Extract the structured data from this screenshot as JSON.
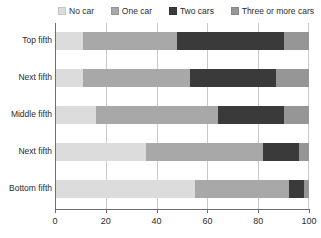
{
  "legend": {
    "position": "top",
    "items": [
      {
        "label": "No car",
        "color": "#dcdcdc",
        "icon": "legend-swatch-no-car"
      },
      {
        "label": "One car",
        "color": "#a8a8a8",
        "icon": "legend-swatch-one-car"
      },
      {
        "label": "Two cars",
        "color": "#3a3a3a",
        "icon": "legend-swatch-two-cars"
      },
      {
        "label": "Three or more cars",
        "color": "#969696",
        "icon": "legend-swatch-three-or-more-cars"
      }
    ]
  },
  "axis": {
    "x_ticks": [
      "0",
      "20",
      "40",
      "60",
      "80",
      "100"
    ],
    "y_labels": [
      "Top fifth",
      "Next fifth",
      "Middle fifth",
      "Next fifth",
      "Bottom fifth"
    ]
  },
  "chart_data": {
    "type": "bar",
    "orientation": "horizontal",
    "stacked": true,
    "stack_mode": "percent",
    "title": "",
    "subtitle": "",
    "xlabel": "",
    "ylabel": "",
    "xlim": [
      0,
      100
    ],
    "xticks": [
      0,
      20,
      40,
      60,
      80,
      100
    ],
    "grid": true,
    "grid_axis": "x",
    "legend_position": "top",
    "categories": [
      "Top fifth",
      "Next fifth",
      "Middle fifth",
      "Next fifth",
      "Bottom fifth"
    ],
    "series": [
      {
        "name": "No car",
        "color": "#dcdcdc",
        "values": [
          11,
          11,
          16,
          36,
          55
        ]
      },
      {
        "name": "One car",
        "color": "#a8a8a8",
        "values": [
          37,
          42,
          48,
          46,
          37
        ]
      },
      {
        "name": "Two cars",
        "color": "#3a3a3a",
        "values": [
          42,
          34,
          26,
          14,
          6
        ]
      },
      {
        "name": "Three or more cars",
        "color": "#969696",
        "values": [
          10,
          13,
          10,
          4,
          2
        ]
      }
    ]
  },
  "colors": {
    "axis": "#6e6e6e",
    "grid": "#c9c9c9",
    "text": "#2b2b2b",
    "background": "#ffffff"
  }
}
